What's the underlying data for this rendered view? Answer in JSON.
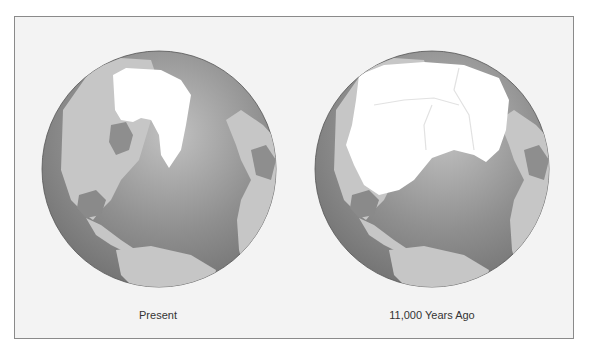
{
  "figure": {
    "panels": [
      {
        "id": "present",
        "caption": "Present"
      },
      {
        "id": "past",
        "caption": "11,000 Years Ago"
      }
    ]
  },
  "colors": {
    "background": "#f3f3f3",
    "frame_border": "#8a8a8a",
    "ocean_dark": "#7a7a7a",
    "ocean_light": "#b8b8b8",
    "land": "#c4c4c4",
    "land_dark": "#8e8e8e",
    "ice": "#ffffff"
  }
}
